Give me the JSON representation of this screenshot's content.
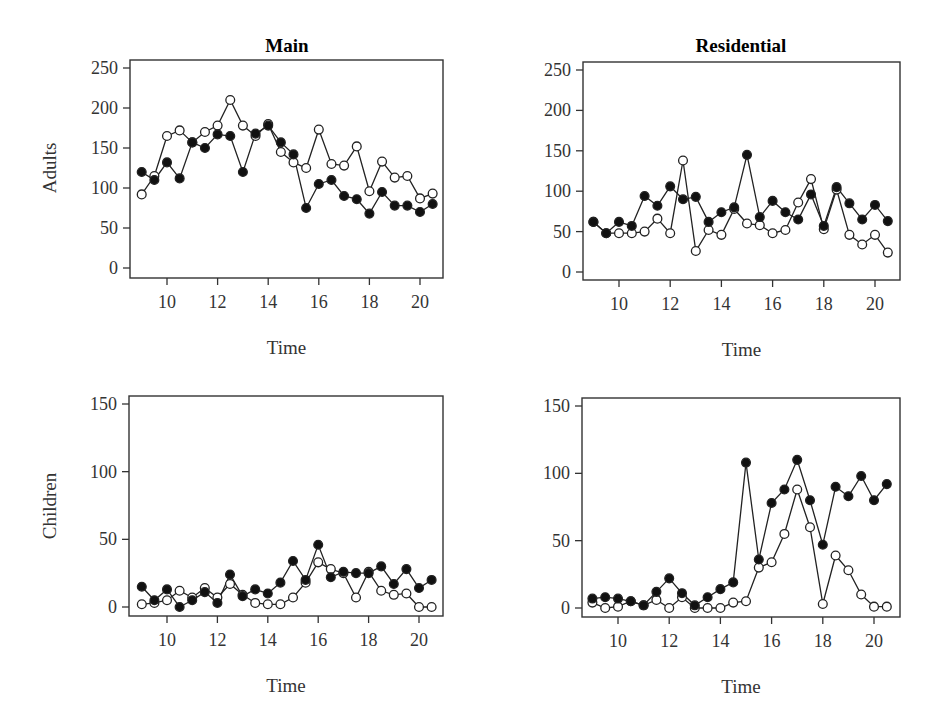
{
  "chart_data": [
    {
      "type": "line",
      "title": "Main",
      "xlabel": "Time",
      "ylabel": "Adults",
      "xlim": [
        8.6,
        20.9
      ],
      "ylim": [
        0,
        250
      ],
      "xticks": [
        10,
        12,
        14,
        16,
        18,
        20
      ],
      "yticks": [
        0,
        50,
        100,
        150,
        200,
        250
      ],
      "x": [
        9,
        9.5,
        10,
        10.5,
        11,
        11.5,
        12,
        12.5,
        13,
        13.5,
        14,
        14.5,
        15,
        15.5,
        16,
        16.5,
        17,
        17.5,
        18,
        18.5,
        19,
        19.5,
        20,
        20.5
      ],
      "series": [
        {
          "name": "filled",
          "marker": "filled-circle",
          "values": [
            120,
            110,
            132,
            112,
            157,
            150,
            167,
            165,
            120,
            168,
            178,
            157,
            142,
            75,
            105,
            110,
            90,
            86,
            68,
            95,
            78,
            78,
            70,
            80
          ]
        },
        {
          "name": "open",
          "marker": "open-circle",
          "values": [
            92,
            115,
            165,
            172,
            157,
            170,
            178,
            210,
            178,
            165,
            180,
            145,
            132,
            125,
            173,
            130,
            128,
            152,
            96,
            133,
            113,
            115,
            87,
            93
          ]
        }
      ],
      "grid": false
    },
    {
      "type": "line",
      "title": "Residential",
      "xlabel": "Time",
      "ylabel": "",
      "xlim": [
        8.6,
        20.9
      ],
      "ylim": [
        0,
        250
      ],
      "xticks": [
        10,
        12,
        14,
        16,
        18,
        20
      ],
      "yticks": [
        0,
        50,
        100,
        150,
        200,
        250
      ],
      "x": [
        9,
        9.5,
        10,
        10.5,
        11,
        11.5,
        12,
        12.5,
        13,
        13.5,
        14,
        14.5,
        15,
        15.5,
        16,
        16.5,
        17,
        17.5,
        18,
        18.5,
        19,
        19.5,
        20,
        20.5
      ],
      "series": [
        {
          "name": "filled",
          "marker": "filled-circle",
          "values": [
            62,
            48,
            62,
            57,
            94,
            82,
            106,
            90,
            93,
            62,
            74,
            80,
            145,
            68,
            88,
            74,
            65,
            96,
            57,
            105,
            85,
            65,
            83,
            63
          ]
        },
        {
          "name": "open",
          "marker": "open-circle",
          "values": [
            62,
            48,
            48,
            48,
            50,
            66,
            48,
            138,
            26,
            52,
            46,
            78,
            60,
            58,
            48,
            52,
            86,
            115,
            53,
            102,
            46,
            34,
            46,
            24
          ]
        }
      ],
      "grid": false
    },
    {
      "type": "line",
      "title": "",
      "xlabel": "Time",
      "ylabel": "Children",
      "xlim": [
        8.6,
        20.9
      ],
      "ylim": [
        0,
        150
      ],
      "xticks": [
        10,
        12,
        14,
        16,
        18,
        20
      ],
      "yticks": [
        0,
        50,
        100,
        150
      ],
      "x": [
        9,
        9.5,
        10,
        10.5,
        11,
        11.5,
        12,
        12.5,
        13,
        13.5,
        14,
        14.5,
        15,
        15.5,
        16,
        16.5,
        17,
        17.5,
        18,
        18.5,
        19,
        19.5,
        20,
        20.5
      ],
      "series": [
        {
          "name": "filled",
          "marker": "filled-circle",
          "values": [
            15,
            5,
            13,
            0,
            5,
            11,
            3,
            24,
            8,
            13,
            10,
            18,
            34,
            20,
            46,
            22,
            26,
            25,
            25,
            30,
            17,
            28,
            14,
            20
          ]
        },
        {
          "name": "open",
          "marker": "open-circle",
          "values": [
            2,
            3,
            5,
            12,
            7,
            14,
            7,
            17,
            9,
            3,
            2,
            2,
            7,
            18,
            33,
            28,
            25,
            7,
            26,
            12,
            9,
            10,
            0,
            0
          ]
        }
      ],
      "grid": false
    },
    {
      "type": "line",
      "title": "",
      "xlabel": "Time",
      "ylabel": "",
      "xlim": [
        8.6,
        20.9
      ],
      "ylim": [
        0,
        150
      ],
      "xticks": [
        10,
        12,
        14,
        16,
        18,
        20
      ],
      "yticks": [
        0,
        50,
        100,
        150
      ],
      "x": [
        9,
        9.5,
        10,
        10.5,
        11,
        11.5,
        12,
        12.5,
        13,
        13.5,
        14,
        14.5,
        15,
        15.5,
        16,
        16.5,
        17,
        17.5,
        18,
        18.5,
        19,
        19.5,
        20,
        20.5
      ],
      "series": [
        {
          "name": "filled",
          "marker": "filled-circle",
          "values": [
            7,
            8,
            7,
            5,
            2,
            12,
            22,
            11,
            2,
            8,
            14,
            19,
            108,
            36,
            78,
            88,
            110,
            80,
            47,
            90,
            83,
            98,
            80,
            92
          ]
        },
        {
          "name": "open",
          "marker": "open-circle",
          "values": [
            4,
            0,
            1,
            5,
            2,
            6,
            0,
            8,
            0,
            0,
            0,
            4,
            5,
            30,
            34,
            55,
            88,
            60,
            3,
            39,
            28,
            10,
            1,
            1
          ]
        }
      ],
      "grid": false
    }
  ],
  "labels": {
    "title_main": "Main",
    "title_residential": "Residential",
    "ylabel_adults": "Adults",
    "ylabel_children": "Children",
    "xlabel": "Time"
  }
}
